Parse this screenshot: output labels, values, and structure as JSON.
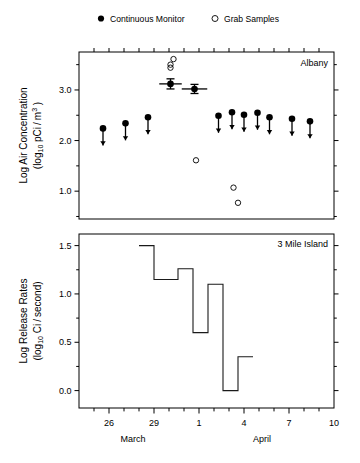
{
  "legend": {
    "position": "top",
    "entries": [
      {
        "label": "Continuous Monitor",
        "marker": "filled-circle"
      },
      {
        "label": "Grab Samples",
        "marker": "open-circle"
      }
    ]
  },
  "panels": [
    {
      "id": "albany",
      "corner_label": "Albany",
      "ylabel_line1": "Log Air Concentration",
      "ylabel_line2_pre": "(log",
      "ylabel_line2_sub": "10",
      "ylabel_line2_mid": " pCi / m",
      "ylabel_line2_sup": "3",
      "ylabel_line2_post": " )",
      "yticks": [
        "3.0",
        "2.0",
        "1.0"
      ]
    },
    {
      "id": "three-mile-island",
      "corner_label": "3 Mile Island",
      "ylabel_line1": "Log Release Rates",
      "ylabel_line2_pre": "(log",
      "ylabel_line2_sub": "10",
      "ylabel_line2_mid": " Ci / second)",
      "yticks": [
        "1.5",
        "1.0",
        "0.5",
        "0.0"
      ]
    }
  ],
  "xaxis": {
    "ticklabels": [
      "26",
      "29",
      "1",
      "4",
      "7",
      "10"
    ],
    "month_labels": [
      "March",
      "April"
    ]
  },
  "colors": {
    "ink": "#000000",
    "axis": "#000000",
    "step_line": "#1a1a1a"
  },
  "chart_data": [
    {
      "type": "scatter",
      "id": "albany-air-concentration",
      "title": "Albany",
      "xlabel": "",
      "ylabel": "Log Air Concentration (log10 pCi/m^3)",
      "xlim": [
        24.0,
        41.0
      ],
      "ylim": [
        0.45,
        3.75
      ],
      "ytick_values": [
        3.0,
        2.0,
        1.0
      ],
      "ytick_labels": [
        "3.0",
        "2.0",
        "1.0"
      ],
      "xtick_values": [
        26,
        29,
        32,
        35,
        38,
        41
      ],
      "xtick_labels": [
        "26",
        "29",
        "1",
        "4",
        "7",
        "10"
      ],
      "grid": false,
      "legend_position": "above-axes",
      "series": [
        {
          "name": "Continuous Monitor",
          "marker": "filled-circle",
          "note": "values with downward arrows are upper limits (non-detects)",
          "points": [
            {
              "x": 25.6,
              "y": 2.24,
              "arrow": true
            },
            {
              "x": 27.1,
              "y": 2.34,
              "arrow": true
            },
            {
              "x": 28.6,
              "y": 2.46,
              "arrow": true
            },
            {
              "x": 30.1,
              "y": 3.12,
              "arrow": false,
              "xerr": 0.75,
              "yerr": 0.1
            },
            {
              "x": 31.7,
              "y": 3.02,
              "arrow": false,
              "xerr": 0.85,
              "yerr": 0.09
            },
            {
              "x": 33.3,
              "y": 2.49,
              "arrow": true
            },
            {
              "x": 34.2,
              "y": 2.56,
              "arrow": true
            },
            {
              "x": 35.0,
              "y": 2.51,
              "arrow": true
            },
            {
              "x": 35.9,
              "y": 2.55,
              "arrow": true
            },
            {
              "x": 36.7,
              "y": 2.46,
              "arrow": true
            },
            {
              "x": 38.2,
              "y": 2.43,
              "arrow": true
            },
            {
              "x": 39.4,
              "y": 2.38,
              "arrow": true
            }
          ]
        },
        {
          "name": "Grab Samples",
          "marker": "open-circle",
          "points": [
            {
              "x": 30.3,
              "y": 3.61
            },
            {
              "x": 30.1,
              "y": 3.5
            },
            {
              "x": 30.1,
              "y": 3.44
            },
            {
              "x": 31.8,
              "y": 1.61
            },
            {
              "x": 34.3,
              "y": 1.07
            },
            {
              "x": 34.6,
              "y": 0.77
            }
          ]
        }
      ]
    },
    {
      "type": "line",
      "id": "three-mile-island-release-rates",
      "subtype": "step",
      "title": "3 Mile Island",
      "xlabel": "March / April",
      "ylabel": "Log Release Rates (log10 Ci/second)",
      "xlim": [
        24.0,
        41.0
      ],
      "ylim": [
        -0.18,
        1.62
      ],
      "ytick_values": [
        1.5,
        1.0,
        0.5,
        0.0
      ],
      "ytick_labels": [
        "1.5",
        "1.0",
        "0.5",
        "0.0"
      ],
      "xtick_values": [
        26,
        29,
        32,
        35,
        38,
        41
      ],
      "xtick_labels": [
        "26",
        "29",
        "1",
        "4",
        "7",
        "10"
      ],
      "grid": false,
      "steps": [
        {
          "x_start": 28.0,
          "x_end": 29.0,
          "y": 1.5
        },
        {
          "x_start": 29.0,
          "x_end": 30.6,
          "y": 1.15
        },
        {
          "x_start": 30.6,
          "x_end": 31.6,
          "y": 1.26
        },
        {
          "x_start": 31.6,
          "x_end": 32.6,
          "y": 0.6
        },
        {
          "x_start": 32.6,
          "x_end": 33.6,
          "y": 1.1
        },
        {
          "x_start": 33.6,
          "x_end": 34.6,
          "y": 0.0
        },
        {
          "x_start": 34.6,
          "x_end": 35.6,
          "y": 0.35
        }
      ]
    }
  ]
}
